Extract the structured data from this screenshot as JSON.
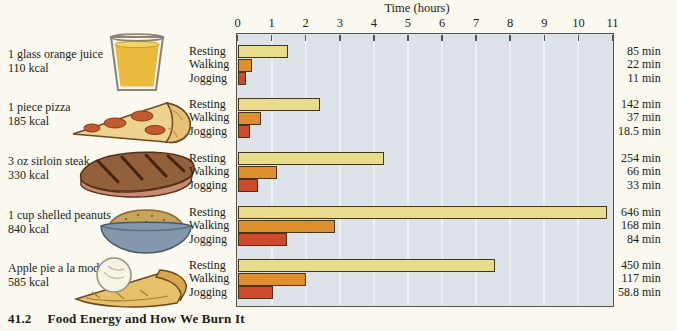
{
  "figure": {
    "caption_number": "41.2",
    "caption_title": "Food Energy and How We Burn It"
  },
  "chart_data": {
    "type": "bar",
    "orientation": "horizontal",
    "title": "",
    "xlabel": "Time (hours)",
    "xlim": [
      0,
      11
    ],
    "x_ticks": [
      "0",
      "1",
      "2",
      "3",
      "4",
      "5",
      "6",
      "7",
      "8",
      "9",
      "10",
      "11"
    ],
    "grid": true,
    "unit_minutes_per_hour": 60,
    "activities": [
      "Resting",
      "Walking",
      "Jogging"
    ],
    "series_colors": {
      "Resting": "#e9dc8d",
      "Walking": "#de8f2b",
      "Jogging": "#cd4a2d"
    },
    "groups": [
      {
        "food": "1 glass orange juice",
        "kcal_label": "110 kcal",
        "icon": "orange-juice-glass",
        "minutes": [
          85,
          22,
          11
        ],
        "minute_labels": [
          "85 min",
          "22 min",
          "11 min"
        ]
      },
      {
        "food": "1 piece pizza",
        "kcal_label": "185 kcal",
        "icon": "pizza-slice",
        "minutes": [
          142,
          37,
          18.5
        ],
        "minute_labels": [
          "142 min",
          "37 min",
          "18.5 min"
        ]
      },
      {
        "food": "3 oz sirloin steak",
        "kcal_label": "330 kcal",
        "icon": "sirloin-steak",
        "minutes": [
          254,
          66,
          33
        ],
        "minute_labels": [
          "254 min",
          "66 min",
          "33 min"
        ]
      },
      {
        "food": "1 cup shelled peanuts",
        "kcal_label": "840 kcal",
        "icon": "peanuts-bowl",
        "minutes": [
          646,
          168,
          84
        ],
        "minute_labels": [
          "646 min",
          "168 min",
          "84 min"
        ]
      },
      {
        "food": "Apple pie a la mode",
        "kcal_label": "585 kcal",
        "icon": "apple-pie-a-la-mode",
        "minutes": [
          450,
          117,
          58.8
        ],
        "minute_labels": [
          "450 min",
          "117 min",
          "58.8 min"
        ]
      }
    ]
  },
  "colors": {
    "page_bg": "#fbf8f0",
    "plot_bg": "#dce2e8",
    "gridline": "#eef1f3",
    "frame": "#56544a",
    "bar_outline": "#453516",
    "text": "#201d16"
  }
}
